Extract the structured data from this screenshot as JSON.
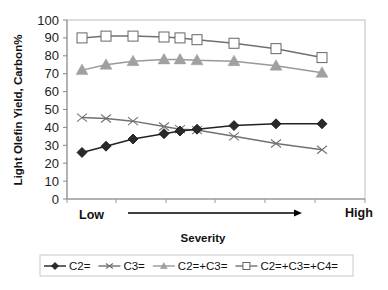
{
  "chart_data": {
    "type": "line",
    "title": "",
    "xlabel": "Severity",
    "ylabel": "Light Olefin Yield, Carbon%",
    "x_start_label": "Low",
    "x_end_label": "High",
    "ylim": [
      0,
      100
    ],
    "yticks": [
      0,
      10,
      20,
      30,
      40,
      50,
      60,
      70,
      80,
      90,
      100
    ],
    "grid": false,
    "legend_position": "bottom",
    "x": [
      1,
      2,
      3,
      4,
      5,
      6,
      7,
      8,
      9
    ],
    "x_pixel": [
      82,
      106,
      133,
      164,
      180,
      197,
      234,
      276,
      322
    ],
    "series": [
      {
        "name": "C2=",
        "marker": "diamond",
        "color": "#222222",
        "values": [
          26,
          29.5,
          33.5,
          36.5,
          38,
          39,
          41,
          42,
          42
        ]
      },
      {
        "name": "C3=",
        "marker": "x",
        "color": "#707070",
        "values": [
          45.5,
          45,
          43.5,
          40.5,
          39,
          38.5,
          35,
          31,
          27.5
        ]
      },
      {
        "name": "C2=+C3=",
        "marker": "triangle",
        "color": "#999999",
        "values": [
          72,
          75,
          77,
          78,
          78,
          77.5,
          77,
          74.5,
          70.5
        ]
      },
      {
        "name": "C2=+C3=+C4=",
        "marker": "square-open",
        "color": "#707070",
        "values": [
          90,
          91,
          91,
          90.5,
          90,
          89,
          87,
          84,
          79
        ]
      }
    ]
  }
}
